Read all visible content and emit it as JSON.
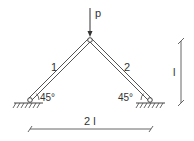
{
  "diagram": {
    "type": "two-bar truss",
    "load": {
      "label": "p",
      "direction": "down"
    },
    "members": [
      {
        "id": "1",
        "label": "1",
        "angle_label": "45°"
      },
      {
        "id": "2",
        "label": "2",
        "angle_label": "45°"
      }
    ],
    "dimensions": {
      "height": "l",
      "span": "2 l"
    },
    "colors": {
      "line": "#444444",
      "background": "#ffffff"
    }
  }
}
